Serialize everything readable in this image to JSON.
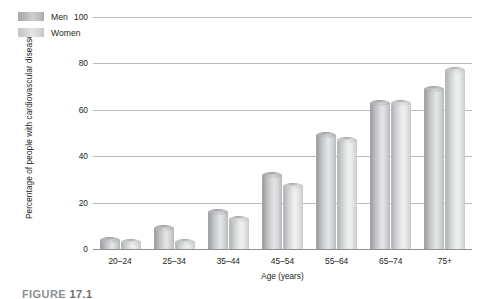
{
  "figure": {
    "caption_prefix": "FIGURE",
    "caption_number": "17.1"
  },
  "chart_data": {
    "type": "bar",
    "title": "",
    "xlabel": "Age (years)",
    "ylabel": "Percentage of people with cardiovascular disease",
    "categories": [
      "20–24",
      "25–34",
      "35–44",
      "45–54",
      "55–64",
      "65–74",
      "75+"
    ],
    "series": [
      {
        "name": "Men",
        "color": "#b7b9bb",
        "values": [
          4,
          9,
          16,
          32,
          49,
          63,
          69
        ]
      },
      {
        "name": "Women",
        "color": "#d5d6d8",
        "values": [
          3,
          3,
          13,
          27,
          47,
          63,
          77
        ]
      }
    ],
    "ylim": [
      0,
      100
    ],
    "yticks": [
      100,
      80,
      60,
      40,
      20,
      0
    ],
    "ytick_labels": [
      "100",
      "80",
      "60",
      "40",
      "20",
      "0"
    ],
    "grid": true,
    "legend_position": "top-left-inside",
    "bar_style": "3d-cylinder"
  }
}
